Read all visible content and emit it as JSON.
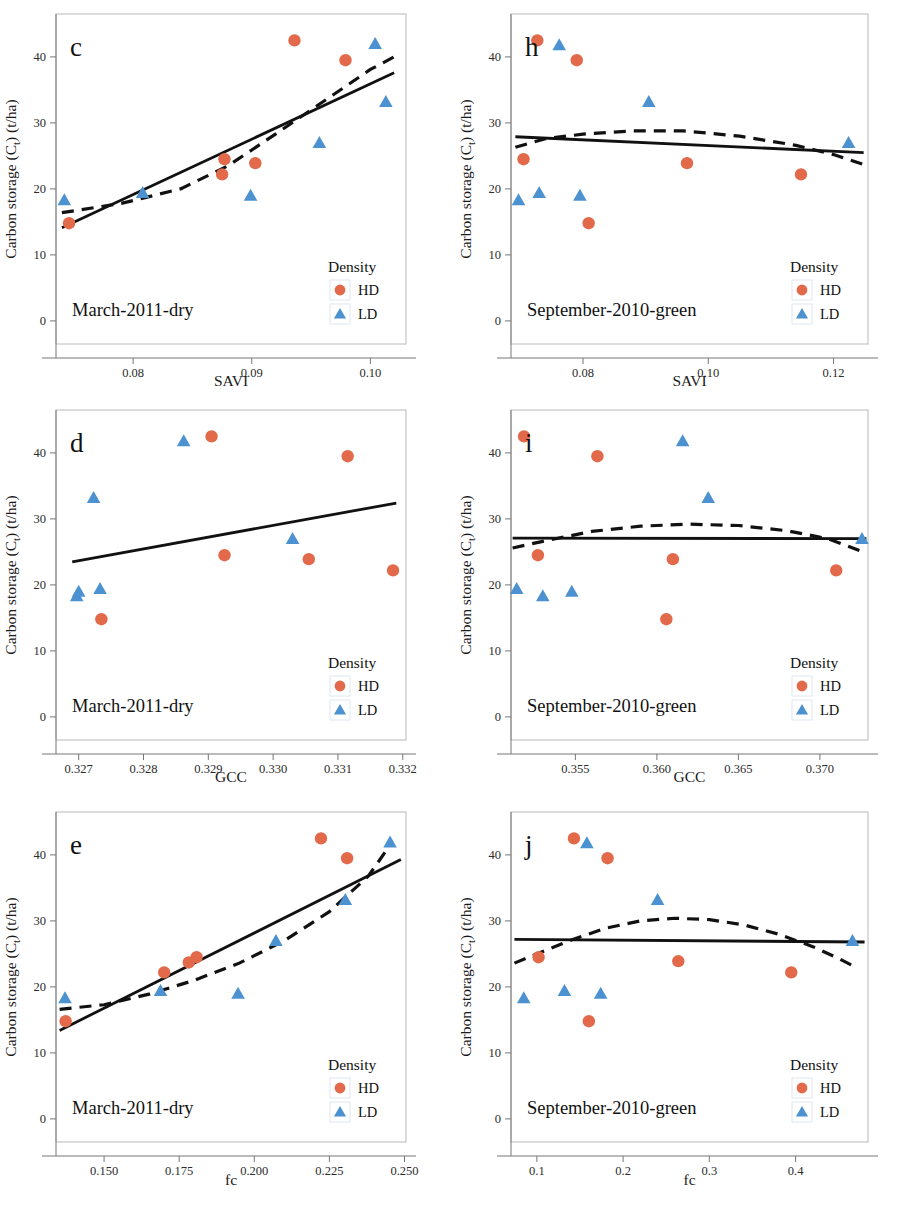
{
  "figure": {
    "y_axis_label": "Carbon storage (C",
    "y_axis_label_sub": "t",
    "y_axis_label_tail": ") (t/ha)",
    "legend_title": "Density",
    "legend_items": [
      {
        "label": "HD",
        "marker": "circle",
        "color": "#E2694A"
      },
      {
        "label": "LD",
        "marker": "triangle",
        "color": "#4D92D0"
      }
    ],
    "colors": {
      "hd": "#E2694A",
      "ld": "#4D92D0",
      "line": "#111111",
      "axis": "#555555"
    },
    "y_ticks": [
      0,
      10,
      20,
      30,
      40
    ],
    "y_range": [
      -3.5,
      46.5
    ]
  },
  "chart_data": [
    {
      "type": "scatter",
      "panel": "c",
      "title": "",
      "season_label": "March‑2011‑dry",
      "xlabel": "SAVI",
      "ylabel": "Carbon storage (Ct) (t/ha)",
      "xlim": [
        0.0735,
        0.103
      ],
      "ylim": [
        -3.5,
        46.5
      ],
      "xticks": [
        0.08,
        0.09,
        0.1
      ],
      "xtick_labels": [
        "0.08",
        "0.09",
        "0.10"
      ],
      "yticks": [
        0,
        10,
        20,
        30,
        40
      ],
      "grid": false,
      "legend_position": "bottom-right",
      "series": [
        {
          "name": "HD",
          "marker": "circle",
          "color": "#E2694A",
          "points": [
            {
              "x": 0.0746,
              "y": 14.8
            },
            {
              "x": 0.0875,
              "y": 22.2
            },
            {
              "x": 0.0877,
              "y": 24.5
            },
            {
              "x": 0.0903,
              "y": 23.9
            },
            {
              "x": 0.0936,
              "y": 42.5
            },
            {
              "x": 0.0979,
              "y": 39.5
            }
          ]
        },
        {
          "name": "LD",
          "marker": "triangle",
          "color": "#4D92D0",
          "points": [
            {
              "x": 0.0742,
              "y": 18.3
            },
            {
              "x": 0.0808,
              "y": 19.4
            },
            {
              "x": 0.0899,
              "y": 19.0
            },
            {
              "x": 0.0957,
              "y": 27.0
            },
            {
              "x": 0.1004,
              "y": 42.0
            },
            {
              "x": 0.1013,
              "y": 33.2
            }
          ]
        }
      ],
      "fits": [
        {
          "style": "solid",
          "kind": "linear",
          "points": [
            [
              0.074,
              14.1
            ],
            [
              0.102,
              37.6
            ]
          ]
        },
        {
          "style": "dashed",
          "kind": "quadratic",
          "points": [
            [
              0.074,
              16.4
            ],
            [
              0.079,
              17.8
            ],
            [
              0.084,
              20.0
            ],
            [
              0.088,
              23.5
            ],
            [
              0.092,
              28.3
            ],
            [
              0.096,
              33.2
            ],
            [
              0.1,
              38.1
            ],
            [
              0.102,
              40.0
            ]
          ]
        }
      ]
    },
    {
      "type": "scatter",
      "panel": "h",
      "title": "",
      "season_label": "September‑2010‑green",
      "xlabel": "SAVI",
      "ylabel": "Carbon storage (Ct) (t/ha)",
      "xlim": [
        0.0685,
        0.1255
      ],
      "ylim": [
        -3.5,
        46.5
      ],
      "xticks": [
        0.08,
        0.1,
        0.12
      ],
      "xtick_labels": [
        "0.08",
        "0.10",
        "0.12"
      ],
      "yticks": [
        0,
        10,
        20,
        30,
        40
      ],
      "grid": false,
      "legend_position": "bottom-right",
      "series": [
        {
          "name": "HD",
          "marker": "circle",
          "color": "#E2694A",
          "points": [
            {
              "x": 0.0705,
              "y": 24.5
            },
            {
              "x": 0.0727,
              "y": 42.5
            },
            {
              "x": 0.079,
              "y": 39.5
            },
            {
              "x": 0.0809,
              "y": 14.8
            },
            {
              "x": 0.0966,
              "y": 23.9
            },
            {
              "x": 0.1148,
              "y": 22.2
            }
          ]
        },
        {
          "name": "LD",
          "marker": "triangle",
          "color": "#4D92D0",
          "points": [
            {
              "x": 0.0697,
              "y": 18.3
            },
            {
              "x": 0.073,
              "y": 19.4
            },
            {
              "x": 0.0762,
              "y": 41.8
            },
            {
              "x": 0.0795,
              "y": 19.0
            },
            {
              "x": 0.0905,
              "y": 33.2
            },
            {
              "x": 0.1224,
              "y": 27.0
            }
          ]
        }
      ],
      "fits": [
        {
          "style": "solid",
          "kind": "linear",
          "points": [
            [
              0.0692,
              27.9
            ],
            [
              0.1248,
              25.5
            ]
          ]
        },
        {
          "style": "dashed",
          "kind": "quadratic",
          "points": [
            [
              0.0692,
              26.3
            ],
            [
              0.074,
              27.6
            ],
            [
              0.08,
              28.3
            ],
            [
              0.088,
              28.8
            ],
            [
              0.096,
              28.8
            ],
            [
              0.105,
              28.0
            ],
            [
              0.114,
              26.6
            ],
            [
              0.12,
              25.2
            ],
            [
              0.1248,
              23.7
            ]
          ]
        }
      ]
    },
    {
      "type": "scatter",
      "panel": "d",
      "title": "",
      "season_label": "March‑2011‑dry",
      "xlabel": "GCC",
      "ylabel": "Carbon storage (Ct) (t/ha)",
      "xlim": [
        0.32665,
        0.33205
      ],
      "ylim": [
        -3.5,
        46.5
      ],
      "xticks": [
        0.327,
        0.328,
        0.329,
        0.33,
        0.331,
        0.332
      ],
      "xtick_labels": [
        "0.327",
        "0.328",
        "0.329",
        "0.330",
        "0.331",
        "0.332"
      ],
      "yticks": [
        0,
        10,
        20,
        30,
        40
      ],
      "grid": false,
      "legend_position": "bottom-right",
      "series": [
        {
          "name": "HD",
          "marker": "circle",
          "color": "#E2694A",
          "points": [
            {
              "x": 0.32735,
              "y": 14.8
            },
            {
              "x": 0.32905,
              "y": 42.5
            },
            {
              "x": 0.32925,
              "y": 24.5
            },
            {
              "x": 0.33055,
              "y": 23.9
            },
            {
              "x": 0.33115,
              "y": 39.5
            },
            {
              "x": 0.33185,
              "y": 22.2
            }
          ]
        },
        {
          "name": "LD",
          "marker": "triangle",
          "color": "#4D92D0",
          "points": [
            {
              "x": 0.32697,
              "y": 18.3
            },
            {
              "x": 0.327,
              "y": 19.0
            },
            {
              "x": 0.32723,
              "y": 33.2
            },
            {
              "x": 0.32733,
              "y": 19.4
            },
            {
              "x": 0.32862,
              "y": 41.8
            },
            {
              "x": 0.3303,
              "y": 27.0
            }
          ]
        }
      ],
      "fits": [
        {
          "style": "solid",
          "kind": "linear",
          "points": [
            [
              0.3269,
              23.5
            ],
            [
              0.3319,
              32.4
            ]
          ]
        }
      ]
    },
    {
      "type": "scatter",
      "panel": "i",
      "title": "",
      "season_label": "September‑2010‑green",
      "xlabel": "GCC",
      "ylabel": "Carbon storage (Ct) (t/ha)",
      "xlim": [
        0.35105,
        0.37295
      ],
      "ylim": [
        -3.5,
        46.5
      ],
      "xticks": [
        0.355,
        0.36,
        0.365,
        0.37
      ],
      "xtick_labels": [
        "0.355",
        "0.360",
        "0.365",
        "0.370"
      ],
      "yticks": [
        0,
        10,
        20,
        30,
        40
      ],
      "grid": false,
      "legend_position": "bottom-right",
      "series": [
        {
          "name": "HD",
          "marker": "circle",
          "color": "#E2694A",
          "points": [
            {
              "x": 0.35185,
              "y": 42.5
            },
            {
              "x": 0.3527,
              "y": 24.5
            },
            {
              "x": 0.35635,
              "y": 39.5
            },
            {
              "x": 0.36058,
              "y": 14.8
            },
            {
              "x": 0.36098,
              "y": 23.9
            },
            {
              "x": 0.371,
              "y": 22.2
            }
          ]
        },
        {
          "name": "LD",
          "marker": "triangle",
          "color": "#4D92D0",
          "points": [
            {
              "x": 0.3514,
              "y": 19.4
            },
            {
              "x": 0.353,
              "y": 18.3
            },
            {
              "x": 0.35478,
              "y": 19.0
            },
            {
              "x": 0.36158,
              "y": 41.8
            },
            {
              "x": 0.36315,
              "y": 33.2
            },
            {
              "x": 0.37258,
              "y": 27.0
            }
          ]
        }
      ],
      "fits": [
        {
          "style": "solid",
          "kind": "linear",
          "points": [
            [
              0.35115,
              27.1
            ],
            [
              0.37285,
              27.0
            ]
          ]
        },
        {
          "style": "dashed",
          "kind": "quadratic",
          "points": [
            [
              0.35115,
              25.6
            ],
            [
              0.353,
              26.6
            ],
            [
              0.356,
              28.1
            ],
            [
              0.359,
              28.9
            ],
            [
              0.362,
              29.2
            ],
            [
              0.365,
              29.0
            ],
            [
              0.368,
              28.2
            ],
            [
              0.3705,
              27.0
            ],
            [
              0.37285,
              24.8
            ]
          ]
        }
      ]
    },
    {
      "type": "scatter",
      "panel": "e",
      "title": "",
      "season_label": "March‑2011‑dry",
      "xlabel": "fc",
      "ylabel": "Carbon storage (Ct) (t/ha)",
      "xlim": [
        0.134,
        0.2505
      ],
      "ylim": [
        -3.5,
        46.5
      ],
      "xticks": [
        0.15,
        0.175,
        0.2,
        0.225,
        0.25
      ],
      "xtick_labels": [
        "0.150",
        "0.175",
        "0.200",
        "0.225",
        "0.250"
      ],
      "yticks": [
        0,
        10,
        20,
        30,
        40
      ],
      "grid": false,
      "legend_position": "bottom-right",
      "series": [
        {
          "name": "HD",
          "marker": "circle",
          "color": "#E2694A",
          "points": [
            {
              "x": 0.1372,
              "y": 14.8
            },
            {
              "x": 0.17,
              "y": 22.2
            },
            {
              "x": 0.1782,
              "y": 23.7
            },
            {
              "x": 0.1808,
              "y": 24.5
            },
            {
              "x": 0.2222,
              "y": 42.5
            },
            {
              "x": 0.2309,
              "y": 39.5
            }
          ]
        },
        {
          "name": "LD",
          "marker": "triangle",
          "color": "#4D92D0",
          "points": [
            {
              "x": 0.137,
              "y": 18.3
            },
            {
              "x": 0.1688,
              "y": 19.4
            },
            {
              "x": 0.1946,
              "y": 19.0
            },
            {
              "x": 0.2072,
              "y": 27.0
            },
            {
              "x": 0.2303,
              "y": 33.2
            },
            {
              "x": 0.2452,
              "y": 41.9
            }
          ]
        }
      ],
      "fits": [
        {
          "style": "solid",
          "kind": "linear",
          "points": [
            [
              0.1352,
              13.4
            ],
            [
              0.2488,
              39.3
            ]
          ]
        },
        {
          "style": "dashed",
          "kind": "quadratic",
          "points": [
            [
              0.1352,
              16.6
            ],
            [
              0.15,
              17.3
            ],
            [
              0.165,
              18.9
            ],
            [
              0.18,
              21.0
            ],
            [
              0.195,
              23.6
            ],
            [
              0.21,
              27.0
            ],
            [
              0.225,
              31.4
            ],
            [
              0.238,
              36.8
            ],
            [
              0.2452,
              41.5
            ]
          ]
        }
      ]
    },
    {
      "type": "scatter",
      "panel": "j",
      "title": "",
      "season_label": "September‑2010‑green",
      "xlabel": "fc",
      "ylabel": "Carbon storage (Ct) (t/ha)",
      "xlim": [
        0.07,
        0.484
      ],
      "ylim": [
        -3.5,
        46.5
      ],
      "xticks": [
        0.1,
        0.2,
        0.3,
        0.4
      ],
      "xtick_labels": [
        "0.1",
        "0.2",
        "0.3",
        "0.4"
      ],
      "yticks": [
        0,
        10,
        20,
        30,
        40
      ],
      "grid": false,
      "legend_position": "bottom-right",
      "series": [
        {
          "name": "HD",
          "marker": "circle",
          "color": "#E2694A",
          "points": [
            {
              "x": 0.102,
              "y": 24.5
            },
            {
              "x": 0.143,
              "y": 42.5
            },
            {
              "x": 0.1603,
              "y": 14.8
            },
            {
              "x": 0.182,
              "y": 39.5
            },
            {
              "x": 0.264,
              "y": 23.9
            },
            {
              "x": 0.395,
              "y": 22.2
            }
          ]
        },
        {
          "name": "LD",
          "marker": "triangle",
          "color": "#4D92D0",
          "points": [
            {
              "x": 0.0848,
              "y": 18.3
            },
            {
              "x": 0.132,
              "y": 19.4
            },
            {
              "x": 0.158,
              "y": 41.8
            },
            {
              "x": 0.174,
              "y": 19.0
            },
            {
              "x": 0.24,
              "y": 33.2
            },
            {
              "x": 0.466,
              "y": 27.0
            }
          ]
        }
      ],
      "fits": [
        {
          "style": "solid",
          "kind": "linear",
          "points": [
            [
              0.074,
              27.2
            ],
            [
              0.48,
              26.8
            ]
          ]
        },
        {
          "style": "dashed",
          "kind": "quadratic",
          "points": [
            [
              0.074,
              23.6
            ],
            [
              0.1,
              25.0
            ],
            [
              0.14,
              27.1
            ],
            [
              0.18,
              28.9
            ],
            [
              0.22,
              30.0
            ],
            [
              0.26,
              30.4
            ],
            [
              0.3,
              30.2
            ],
            [
              0.34,
              29.4
            ],
            [
              0.38,
              28.0
            ],
            [
              0.42,
              26.1
            ],
            [
              0.45,
              24.3
            ],
            [
              0.468,
              23.1
            ]
          ]
        }
      ]
    }
  ]
}
